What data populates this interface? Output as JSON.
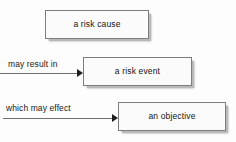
{
  "diagram": {
    "background_color": "#fdfdfd",
    "node_fill_color": "#fbfbfb",
    "node_border_color": "#7d7d7d",
    "shadow_color": "#b9b9b9",
    "text_color": "#141414",
    "nodes": [
      {
        "id": "risk-cause",
        "label": "a risk cause"
      },
      {
        "id": "risk-event",
        "label": "a risk event"
      },
      {
        "id": "objective",
        "label": "an objective"
      }
    ],
    "connectors": [
      {
        "id": "result",
        "label": "may result in",
        "from": "risk-cause",
        "to": "risk-event"
      },
      {
        "id": "effect",
        "label": "which may effect",
        "from": "risk-event",
        "to": "objective"
      }
    ]
  }
}
